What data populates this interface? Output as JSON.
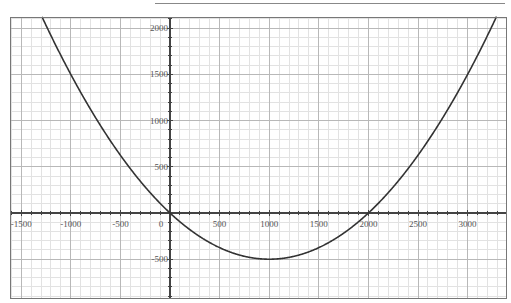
{
  "header": {
    "clipped_title": "~~~ ~~~~~~~ ~~~ ~~~~~ ~~"
  },
  "chart_data": {
    "type": "line",
    "title": "",
    "xlabel": "",
    "ylabel": "",
    "function": "y = x^2/2000 - x",
    "xlim": [
      -1600,
      3400
    ],
    "ylim": [
      -900,
      2100
    ],
    "grid": true,
    "minor_grid_step": 100,
    "major_grid_step": 500,
    "x_ticks": [
      -1500,
      -1000,
      -500,
      0,
      500,
      1000,
      1500,
      2000,
      2500,
      3000
    ],
    "x_tick_labels": [
      "-1500",
      "-1000",
      "-500",
      "0",
      "500",
      "1000",
      "1500",
      "2000",
      "2500",
      "3000"
    ],
    "y_ticks": [
      -500,
      500,
      1000,
      1500,
      2000
    ],
    "y_tick_labels": [
      "-500",
      "500",
      "1000",
      "1500",
      "2000"
    ],
    "series": [
      {
        "name": "parabola",
        "color": "#333333",
        "x": [
          -1300,
          -1000,
          -500,
          0,
          500,
          1000,
          1500,
          2000,
          2500,
          3000,
          3300
        ],
        "y": [
          2145,
          1500,
          625,
          0,
          -375,
          -500,
          -375,
          0,
          625,
          1500,
          2145
        ]
      }
    ],
    "key_points": {
      "vertex": [
        1000,
        -500
      ],
      "roots": [
        0,
        2000
      ]
    }
  },
  "colors": {
    "curve": "#333333",
    "axis": "#444444",
    "major_grid": "#b8b8b8",
    "minor_grid": "#e2e2e2",
    "frame": "#777777"
  }
}
